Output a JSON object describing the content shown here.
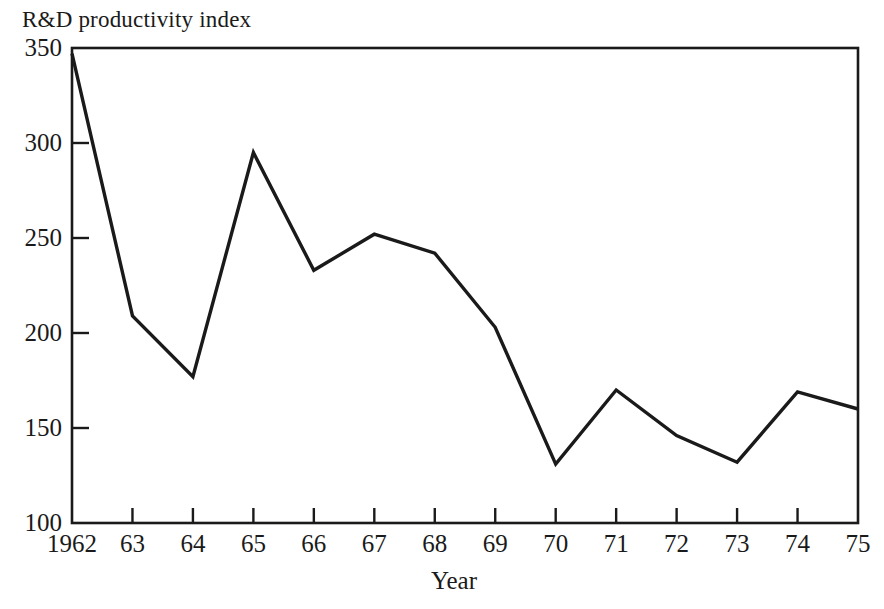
{
  "chart_data": {
    "type": "line",
    "title": "R&D productivity index",
    "xlabel": "Year",
    "ylabel": "",
    "x": [
      1962,
      1963,
      1964,
      1965,
      1966,
      1967,
      1968,
      1969,
      1970,
      1971,
      1972,
      1973,
      1974,
      1975
    ],
    "values": [
      347,
      209,
      177,
      295,
      233,
      252,
      242,
      203,
      131,
      170,
      146,
      132,
      169,
      160
    ],
    "series": [
      {
        "name": "R&D productivity index",
        "values": [
          347,
          209,
          177,
          295,
          233,
          252,
          242,
          203,
          131,
          170,
          146,
          132,
          169,
          160
        ]
      }
    ],
    "xtick_labels": [
      "1962",
      "63",
      "64",
      "65",
      "66",
      "67",
      "68",
      "69",
      "70",
      "71",
      "72",
      "73",
      "74",
      "75"
    ],
    "ytick_labels": [
      "100",
      "150",
      "200",
      "250",
      "300",
      "350"
    ],
    "ytick_values": [
      100,
      150,
      200,
      250,
      300,
      350
    ],
    "ylim": [
      100,
      350
    ],
    "xlim": [
      1962,
      1975
    ],
    "grid": false,
    "legend": false,
    "line_color": "#1a1a1a",
    "frame_color": "#1a1a1a",
    "background_color": "#ffffff"
  }
}
